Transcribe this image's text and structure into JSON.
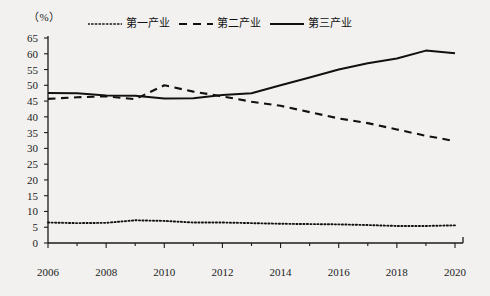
{
  "chart_data": {
    "type": "line",
    "title": "",
    "unit_label": "（%）",
    "xlabel": "",
    "ylabel": "",
    "x": [
      2006,
      2007,
      2008,
      2009,
      2010,
      2011,
      2012,
      2013,
      2014,
      2015,
      2016,
      2017,
      2018,
      2019,
      2020
    ],
    "xlim": [
      2006,
      2020
    ],
    "ylim": [
      0,
      65
    ],
    "ytick_step": 5,
    "xtick_labels": [
      "2006",
      "2008",
      "2010",
      "2012",
      "2014",
      "2016",
      "2018",
      "2020"
    ],
    "xtick_values": [
      2006,
      2008,
      2010,
      2012,
      2014,
      2016,
      2018,
      2020
    ],
    "ytick_labels": [
      "0",
      "5",
      "10",
      "15",
      "20",
      "25",
      "30",
      "35",
      "40",
      "45",
      "50",
      "55",
      "60",
      "65"
    ],
    "ytick_values": [
      0,
      5,
      10,
      15,
      20,
      25,
      30,
      35,
      40,
      45,
      50,
      55,
      60,
      65
    ],
    "grid": false,
    "legend_position": "top",
    "series": [
      {
        "name": "第一产业",
        "style": "dotted",
        "color": "#111111",
        "values": [
          6.5,
          6.3,
          6.4,
          7.2,
          7.0,
          6.5,
          6.5,
          6.3,
          6.1,
          6.0,
          5.9,
          5.7,
          5.4,
          5.4,
          5.6
        ]
      },
      {
        "name": "第二产业",
        "style": "dashed",
        "color": "#111111",
        "values": [
          45.7,
          46.2,
          46.5,
          45.6,
          50.0,
          48.0,
          46.5,
          44.8,
          43.5,
          41.5,
          39.5,
          38.0,
          36.0,
          34.0,
          32.3
        ]
      },
      {
        "name": "第三产业",
        "style": "solid",
        "color": "#111111",
        "values": [
          47.6,
          47.5,
          46.8,
          46.7,
          45.8,
          45.9,
          46.9,
          47.5,
          50.0,
          52.5,
          55.0,
          57.0,
          58.5,
          61.0,
          60.2
        ]
      }
    ]
  }
}
